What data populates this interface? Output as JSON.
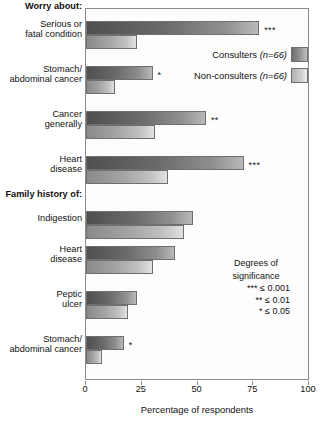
{
  "chart_data": {
    "type": "bar",
    "orientation": "horizontal",
    "title": "",
    "xlabel": "Percentage of respondents",
    "ylabel": "",
    "xlim": [
      0,
      100
    ],
    "xticks": [
      0,
      25,
      50,
      75,
      100
    ],
    "grid": false,
    "legend_position": "top-right",
    "sections": [
      {
        "label": "Worry about:"
      },
      {
        "label": "Family history of:"
      }
    ],
    "categories": [
      "Serious or fatal condition",
      "Stomach/ abdominal cancer",
      "Cancer generally",
      "Heart disease",
      "Indigestion",
      "Heart disease",
      "Peptic ulcer",
      "Stomach/ abdominal cancer"
    ],
    "series": [
      {
        "name": "Consulters (n=66)",
        "values": [
          78,
          30,
          54,
          71,
          48,
          40,
          23,
          17
        ]
      },
      {
        "name": "Non-consulters (n=66)",
        "values": [
          23,
          13,
          31,
          37,
          44,
          30,
          19,
          7
        ]
      }
    ],
    "significance": [
      "***",
      "*",
      "**",
      "***",
      "",
      "",
      "",
      "*"
    ]
  },
  "sections": {
    "worry": "Worry about:",
    "family_history": "Family history of:"
  },
  "categories": [
    {
      "line1": "Serious or",
      "line2": "fatal condition"
    },
    {
      "line1": "Stomach/",
      "line2": "abdominal cancer"
    },
    {
      "line1": "Cancer",
      "line2": "generally"
    },
    {
      "line1": "Heart",
      "line2": "disease"
    },
    {
      "line1": "Indigestion",
      "line2": ""
    },
    {
      "line1": "Heart",
      "line2": "disease"
    },
    {
      "line1": "Peptic",
      "line2": "ulcer"
    },
    {
      "line1": "Stomach/",
      "line2": "abdominal cancer"
    }
  ],
  "legend": {
    "consulters": {
      "name": "Consulters",
      "n": "(n=66)"
    },
    "nonconsulters": {
      "name": "Non-consulters",
      "n": "(n=66)"
    }
  },
  "significance_key": {
    "title_line1": "Degrees of",
    "title_line2": "significance",
    "rows": [
      {
        "stars": "***",
        "value": "≤ 0.001"
      },
      {
        "stars": "**",
        "value": "≤ 0.01"
      },
      {
        "stars": "*",
        "value": "≤ 0.05"
      }
    ]
  },
  "axis": {
    "ticks": [
      "0",
      "25",
      "50",
      "75",
      "100"
    ],
    "title": "Percentage of respondents"
  },
  "colors": {
    "consulters_dark": "#4f4f4f",
    "consulters_light": "#b9b9b9",
    "nonconsulters_dark": "#8a8a8a",
    "nonconsulters_light": "#e2e2e2",
    "frame": "#8b8b8b"
  }
}
